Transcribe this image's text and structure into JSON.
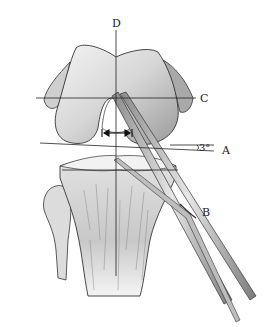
{
  "figure": {
    "labels": {
      "a": "A",
      "b": "B",
      "c": "C",
      "d": "D"
    },
    "angle_annotation": "3°",
    "colors": {
      "ink": "#222222",
      "bone_light": "#e8e8e8",
      "bone_mid": "#bdbdbd",
      "bone_dark": "#7a7a7a",
      "background": "#ffffff"
    }
  }
}
